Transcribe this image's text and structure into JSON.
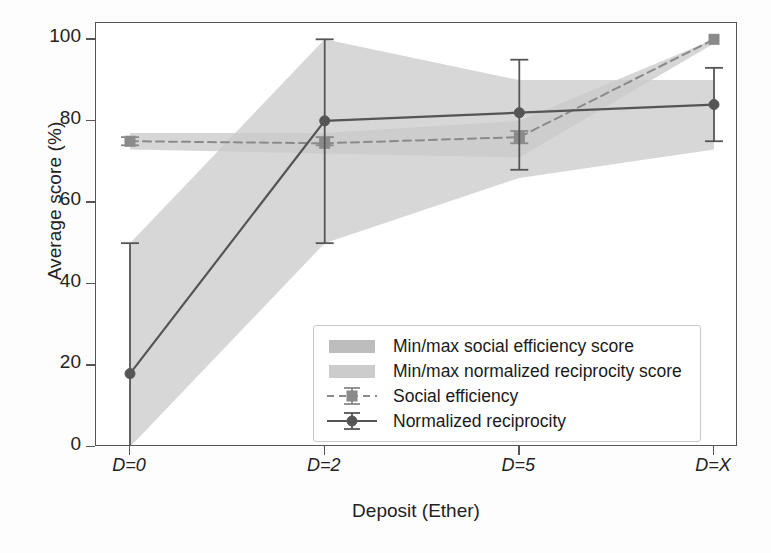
{
  "chart_data": {
    "type": "line",
    "title": "",
    "xlabel": "Deposit (Ether)",
    "ylabel": "Average score (%)",
    "categories": [
      "D=0",
      "D=2",
      "D=5",
      "D=X"
    ],
    "xlim": [
      0,
      3
    ],
    "ylim": [
      0,
      104
    ],
    "yticks": [
      0,
      20,
      40,
      60,
      80,
      100
    ],
    "ytick_labels": [
      "0",
      "20",
      "40",
      "60",
      "80",
      "100"
    ],
    "grid": false,
    "legend_position": "lower right",
    "series": [
      {
        "name": "Social efficiency",
        "style": "dashed-line-with-square-markers-and-errorbars",
        "color": "#8a8a8a",
        "values": [
          75,
          74.5,
          76,
          100
        ],
        "err_low": [
          74,
          74,
          74.5,
          100
        ],
        "err_high": [
          76,
          76,
          77.5,
          100
        ]
      },
      {
        "name": "Normalized reciprocity",
        "style": "solid-line-with-circle-markers-and-errorbars",
        "color": "#555555",
        "values": [
          18,
          80,
          82,
          84
        ],
        "err_low": [
          0,
          50,
          68,
          75
        ],
        "err_high": [
          50,
          100,
          95,
          93
        ]
      }
    ],
    "bands": [
      {
        "name": "Min/max social efficiency score",
        "color": "#b5b5b5",
        "opacity": 0.55,
        "lower": [
          73,
          72,
          71,
          99
        ],
        "upper": [
          77,
          77,
          80,
          100
        ]
      },
      {
        "name": "Min/max normalized reciprocity score",
        "color": "#c9c9c9",
        "opacity": 0.75,
        "lower": [
          0,
          50,
          66,
          73
        ],
        "upper": [
          50,
          100,
          90,
          90
        ]
      }
    ]
  },
  "axes": {
    "ylabel": "Average score (%)",
    "xlabel": "Deposit (Ether)",
    "ytick_labels": [
      "100",
      "80",
      "60",
      "40",
      "20",
      "0"
    ],
    "xtick_labels": [
      "D=0",
      "D=2",
      "D=5",
      "D=X"
    ]
  },
  "legend": {
    "entries": [
      {
        "label": "Min/max social efficiency score",
        "key": "band-swatch",
        "color": "#bdbdbd"
      },
      {
        "label": "Min/max normalized reciprocity score",
        "key": "band-swatch",
        "color": "#cccccc"
      },
      {
        "label": "Social efficiency",
        "key": "dashed-marker-line",
        "color": "#8a8a8a"
      },
      {
        "label": "Normalized reciprocity",
        "key": "solid-marker-line",
        "color": "#555555"
      }
    ]
  }
}
